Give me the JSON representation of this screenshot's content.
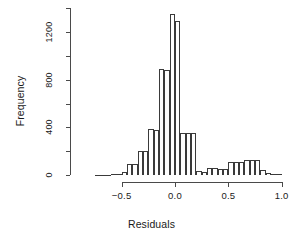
{
  "chart_data": {
    "type": "bar",
    "title": "",
    "subtitle": "",
    "xlabel": "Residuals",
    "ylabel": "Frequency",
    "xlim": [
      -0.8,
      1.05
    ],
    "ylim": [
      0,
      1400
    ],
    "grid": false,
    "legend": null,
    "bin_width": 0.05,
    "x_ticks": [
      {
        "value": -0.5,
        "label": "-0.5"
      },
      {
        "value": 0.0,
        "label": "0.0"
      },
      {
        "value": 0.5,
        "label": "0.5"
      },
      {
        "value": 1.0,
        "label": "1.0"
      }
    ],
    "y_ticks": [
      {
        "value": 0,
        "label": "0"
      },
      {
        "value": 200,
        "label": ""
      },
      {
        "value": 400,
        "label": "400"
      },
      {
        "value": 600,
        "label": ""
      },
      {
        "value": 800,
        "label": "800"
      },
      {
        "value": 1000,
        "label": ""
      },
      {
        "value": 1200,
        "label": "1200"
      },
      {
        "value": 1400,
        "label": ""
      }
    ],
    "bins": [
      {
        "x0": -0.75,
        "x1": -0.7,
        "value": 2
      },
      {
        "x0": -0.7,
        "x1": -0.65,
        "value": 3
      },
      {
        "x0": -0.65,
        "x1": -0.6,
        "value": 4
      },
      {
        "x0": -0.6,
        "x1": -0.55,
        "value": 6
      },
      {
        "x0": -0.55,
        "x1": -0.5,
        "value": 10
      },
      {
        "x0": -0.5,
        "x1": -0.45,
        "value": 22
      },
      {
        "x0": -0.45,
        "x1": -0.4,
        "value": 95
      },
      {
        "x0": -0.4,
        "x1": -0.35,
        "value": 92
      },
      {
        "x0": -0.35,
        "x1": -0.3,
        "value": 205
      },
      {
        "x0": -0.3,
        "x1": -0.25,
        "value": 200
      },
      {
        "x0": -0.25,
        "x1": -0.2,
        "value": 385
      },
      {
        "x0": -0.2,
        "x1": -0.15,
        "value": 380
      },
      {
        "x0": -0.15,
        "x1": -0.1,
        "value": 890
      },
      {
        "x0": -0.1,
        "x1": -0.05,
        "value": 885
      },
      {
        "x0": -0.05,
        "x1": 0.0,
        "value": 1350
      },
      {
        "x0": 0.0,
        "x1": 0.05,
        "value": 1290
      },
      {
        "x0": 0.05,
        "x1": 0.1,
        "value": 355
      },
      {
        "x0": 0.1,
        "x1": 0.15,
        "value": 350
      },
      {
        "x0": 0.15,
        "x1": 0.2,
        "value": 350
      },
      {
        "x0": 0.2,
        "x1": 0.25,
        "value": 30
      },
      {
        "x0": 0.25,
        "x1": 0.3,
        "value": 28
      },
      {
        "x0": 0.3,
        "x1": 0.35,
        "value": 60
      },
      {
        "x0": 0.35,
        "x1": 0.4,
        "value": 58
      },
      {
        "x0": 0.4,
        "x1": 0.45,
        "value": 50
      },
      {
        "x0": 0.45,
        "x1": 0.5,
        "value": 48
      },
      {
        "x0": 0.5,
        "x1": 0.55,
        "value": 112
      },
      {
        "x0": 0.55,
        "x1": 0.6,
        "value": 110
      },
      {
        "x0": 0.6,
        "x1": 0.65,
        "value": 110
      },
      {
        "x0": 0.65,
        "x1": 0.7,
        "value": 128
      },
      {
        "x0": 0.7,
        "x1": 0.75,
        "value": 126
      },
      {
        "x0": 0.75,
        "x1": 0.8,
        "value": 126
      },
      {
        "x0": 0.8,
        "x1": 0.85,
        "value": 45
      },
      {
        "x0": 0.85,
        "x1": 0.9,
        "value": 18
      },
      {
        "x0": 0.9,
        "x1": 0.95,
        "value": 12
      },
      {
        "x0": 0.95,
        "x1": 1.0,
        "value": 8
      }
    ]
  },
  "style": {
    "bar_stroke": "#3a3a3a",
    "bar_fill": "#ffffff",
    "axis_color": "#4a4a4a",
    "text_color": "#1a1a1a",
    "background": "#ffffff"
  }
}
